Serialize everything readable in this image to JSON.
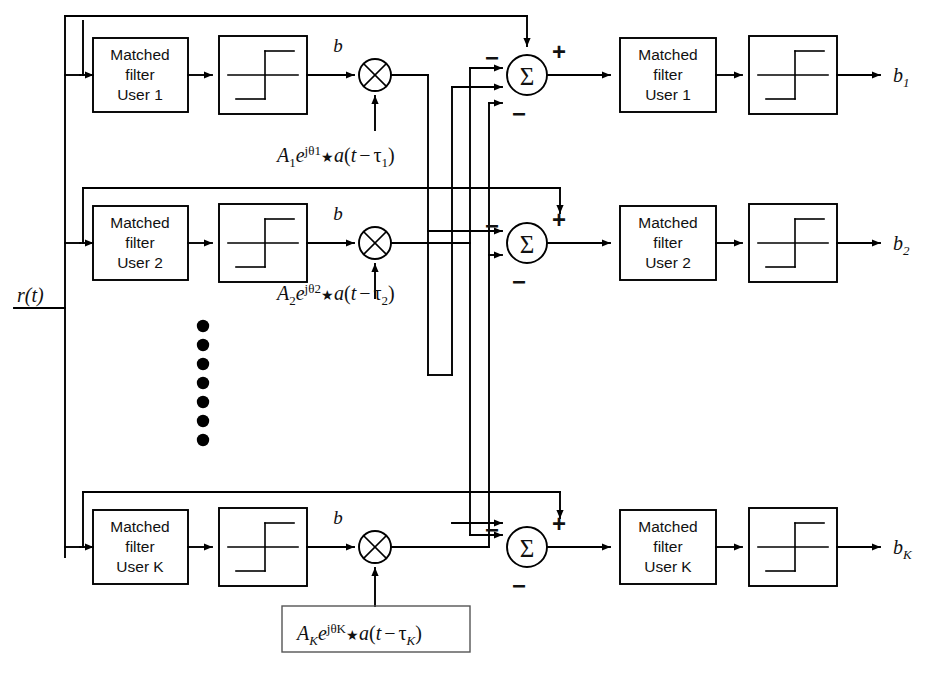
{
  "diagram": {
    "input": {
      "label": "r(t)"
    },
    "stroke_color": "#000000",
    "background_color": "#ffffff",
    "ellipsis_dots": 7,
    "rows": [
      {
        "id": "user1",
        "matched_filter_line1": "Matched",
        "matched_filter_line2": "filter",
        "matched_filter_line3": "User 1",
        "limiter_name": "hard-limiter",
        "multiplier_symbol": "⊗",
        "b_label": "b",
        "weight_A": "A",
        "weight_A_sub": "1",
        "weight_e": "e",
        "weight_exp": "jθ1",
        "weight_star": "★",
        "weight_a": "a",
        "weight_arg_open": "(",
        "weight_t": "t",
        "weight_minus": "−",
        "weight_tau": "τ",
        "weight_tau_sub": "1",
        "weight_arg_close": ")",
        "weight_boxed": false,
        "sum_symbol": "Σ",
        "sum_plus": "+",
        "sum_minus_top": "−",
        "sum_minus_bottom": "−",
        "matched_filter2_line1": "Matched",
        "matched_filter2_line2": "filter",
        "matched_filter2_line3": "User 1",
        "output_label": "b",
        "output_sub": "1"
      },
      {
        "id": "user2",
        "matched_filter_line1": "Matched",
        "matched_filter_line2": "filter",
        "matched_filter_line3": "User 2",
        "limiter_name": "hard-limiter",
        "multiplier_symbol": "⊗",
        "b_label": "b",
        "weight_A": "A",
        "weight_A_sub": "2",
        "weight_e": "e",
        "weight_exp": "jθ2",
        "weight_star": "★",
        "weight_a": "a",
        "weight_arg_open": "(",
        "weight_t": "t",
        "weight_minus": "−",
        "weight_tau": "τ",
        "weight_tau_sub": "2",
        "weight_arg_close": ")",
        "weight_boxed": false,
        "sum_symbol": "Σ",
        "sum_plus": "+",
        "sum_minus_top": "−",
        "sum_minus_bottom": "−",
        "matched_filter2_line1": "Matched",
        "matched_filter2_line2": "filter",
        "matched_filter2_line3": "User 2",
        "output_label": "b",
        "output_sub": "2"
      },
      {
        "id": "userK",
        "matched_filter_line1": "Matched",
        "matched_filter_line2": "filter",
        "matched_filter_line3": "User K",
        "limiter_name": "hard-limiter",
        "multiplier_symbol": "⊗",
        "b_label": "b",
        "weight_A": "A",
        "weight_A_sub": "K",
        "weight_e": "e",
        "weight_exp": "jθK",
        "weight_star": "★",
        "weight_a": "a",
        "weight_arg_open": "(",
        "weight_t": "t",
        "weight_minus": "−",
        "weight_tau": "τ",
        "weight_tau_sub": "K",
        "weight_arg_close": ")",
        "weight_boxed": true,
        "sum_symbol": "Σ",
        "sum_plus": "+",
        "sum_minus_top": "−",
        "sum_minus_bottom": "−",
        "matched_filter2_line1": "Matched",
        "matched_filter2_line2": "filter",
        "matched_filter2_line3": "User K",
        "output_label": "b",
        "output_sub": "K"
      }
    ]
  }
}
